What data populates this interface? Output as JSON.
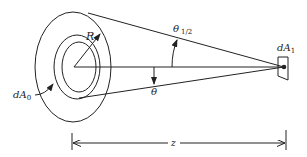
{
  "figure": {
    "labels": {
      "radius": "R",
      "source_area": "dA",
      "source_area_sub": "0",
      "target_area": "dA",
      "target_area_sub": "1",
      "half_angle": "θ",
      "half_angle_sub": "1/2",
      "angle": "θ",
      "distance": "z"
    },
    "colors": {
      "stroke": "#222222",
      "background": "#ffffff"
    }
  }
}
